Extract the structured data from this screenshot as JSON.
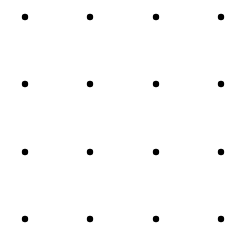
{
  "diagram": {
    "type": "dot-grid",
    "rows": 4,
    "cols": 4,
    "x_positions": [
      25,
      90,
      156,
      221
    ],
    "y_positions": [
      17,
      84,
      152,
      219
    ],
    "dot_radius": 3.2,
    "dot_color": "#000000",
    "background": "#ffffff"
  }
}
